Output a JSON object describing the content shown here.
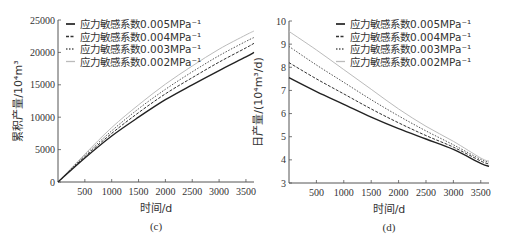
{
  "chart_data": [
    {
      "type": "line",
      "caption": "(c)",
      "title": "",
      "xlabel": "时间/d",
      "ylabel": "累积产量/10⁴m³",
      "xlim": [
        0,
        3650
      ],
      "ylim": [
        0,
        25000
      ],
      "xticks": [
        500,
        1000,
        1500,
        2000,
        2500,
        3000,
        3500
      ],
      "yticks": [
        0,
        5000,
        10000,
        15000,
        20000,
        25000
      ],
      "grid": false,
      "legend_position": "top-left",
      "x": [
        0,
        500,
        1000,
        1500,
        2000,
        2500,
        3000,
        3500,
        3650
      ],
      "series": [
        {
          "name": "应力敏感系数0.005MPa⁻¹",
          "style": "solid-dark",
          "values": [
            0,
            3700,
            7100,
            10000,
            12700,
            15000,
            17200,
            19300,
            20000
          ]
        },
        {
          "name": "应力敏感系数0.004MPa⁻¹",
          "style": "dashed",
          "values": [
            0,
            3900,
            7500,
            10700,
            13600,
            16100,
            18500,
            20700,
            21400
          ]
        },
        {
          "name": "应力敏感系数0.003MPa⁻¹",
          "style": "dotted",
          "values": [
            0,
            4100,
            7900,
            11300,
            14300,
            17000,
            19500,
            21700,
            22300
          ]
        },
        {
          "name": "应力敏感系数0.002MPa⁻¹",
          "style": "solid-light",
          "values": [
            0,
            4300,
            8400,
            11900,
            15100,
            17900,
            20500,
            22700,
            23300
          ]
        }
      ]
    },
    {
      "type": "line",
      "caption": "(d)",
      "title": "",
      "xlabel": "时间/d",
      "ylabel": "日产量/(10⁴m³/d)",
      "xlim": [
        0,
        3650
      ],
      "ylim": [
        3,
        10
      ],
      "xticks": [
        500,
        1000,
        1500,
        2000,
        2500,
        3000,
        3500
      ],
      "yticks": [
        3,
        4,
        5,
        6,
        7,
        8,
        9,
        10
      ],
      "grid": false,
      "legend_position": "top-right",
      "x": [
        0,
        500,
        1000,
        1500,
        2000,
        2500,
        3000,
        3500,
        3650
      ],
      "series": [
        {
          "name": "应力敏感系数0.005MPa⁻¹",
          "style": "solid-dark",
          "values": [
            7.55,
            6.95,
            6.4,
            5.85,
            5.35,
            4.9,
            4.45,
            3.85,
            3.72
          ]
        },
        {
          "name": "应力敏感系数0.004MPa⁻¹",
          "style": "dashed",
          "values": [
            8.2,
            7.5,
            6.85,
            6.2,
            5.6,
            5.05,
            4.55,
            3.95,
            3.82
          ]
        },
        {
          "name": "应力敏感系数0.003MPa⁻¹",
          "style": "dotted",
          "values": [
            8.9,
            8.1,
            7.35,
            6.6,
            5.9,
            5.25,
            4.65,
            4.02,
            3.9
          ]
        },
        {
          "name": "应力敏感系数0.002MPa⁻¹",
          "style": "solid-light",
          "values": [
            9.55,
            8.75,
            7.9,
            7.05,
            6.2,
            5.45,
            4.8,
            4.08,
            3.95
          ]
        }
      ]
    }
  ],
  "colors": {
    "axis": "#555555",
    "solid-dark": "#222222",
    "dashed": "#333333",
    "dotted": "#555555",
    "solid-light": "#bbbbbb"
  }
}
